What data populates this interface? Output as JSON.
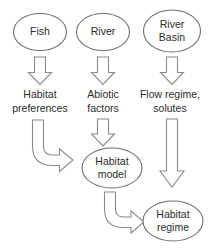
{
  "diagram": {
    "background_color": "#ffffff",
    "line_color": "#6e6e6e",
    "arrow_color": "#8a8a8a",
    "text_color": "#2b2b2b",
    "nodes": [
      {
        "id": "fish",
        "label": "Fish",
        "shape": "ellipse",
        "lines": [
          "Fish"
        ]
      },
      {
        "id": "river",
        "label": "River",
        "shape": "ellipse",
        "lines": [
          "River"
        ]
      },
      {
        "id": "river-basin",
        "label": "River Basin",
        "shape": "ellipse",
        "lines": [
          "River",
          "Basin"
        ]
      },
      {
        "id": "habitat-model",
        "label": "Habitat model",
        "shape": "ellipse",
        "lines": [
          "Habitat",
          "model"
        ]
      },
      {
        "id": "habitat-regime",
        "label": "Habitat regime",
        "shape": "ellipse",
        "lines": [
          "Habitat",
          "regime"
        ]
      }
    ],
    "labels": [
      {
        "id": "habitat-preferences",
        "label": "Habitat preferences",
        "lines": [
          "Habitat",
          "preferences"
        ]
      },
      {
        "id": "abiotic-factors",
        "label": "Abiotic factors",
        "lines": [
          "Abiotic",
          "factors"
        ]
      },
      {
        "id": "flow-regime-solutes",
        "label": "Flow regime, solutes",
        "lines": [
          "Flow regime,",
          "solutes"
        ]
      }
    ],
    "arrows": [
      {
        "id": "fish-to-habitat-preferences",
        "type": "block-down",
        "direction": "down"
      },
      {
        "id": "river-to-abiotic-factors",
        "type": "block-down",
        "direction": "down"
      },
      {
        "id": "river-basin-to-flow-regime",
        "type": "block-down",
        "direction": "down"
      },
      {
        "id": "habitat-preferences-to-model",
        "type": "block-curved",
        "direction": "down-right"
      },
      {
        "id": "abiotic-factors-to-model",
        "type": "block-down",
        "direction": "down"
      },
      {
        "id": "flow-regime-to-habitat-regime",
        "type": "block-down-long",
        "direction": "down"
      },
      {
        "id": "habitat-model-to-habitat-regime",
        "type": "block-curved",
        "direction": "down-right"
      }
    ]
  }
}
